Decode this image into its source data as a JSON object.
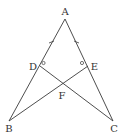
{
  "diagram": {
    "type": "geometry",
    "points": {
      "A": {
        "label": "A",
        "x": 65,
        "y": 19
      },
      "B": {
        "label": "B",
        "x": 9,
        "y": 121
      },
      "C": {
        "label": "C",
        "x": 113,
        "y": 121
      },
      "D": {
        "label": "D",
        "x": 40,
        "y": 66
      },
      "E": {
        "label": "E",
        "x": 88,
        "y": 66
      },
      "F": {
        "label": "F",
        "x": 63,
        "y": 82
      }
    },
    "segments": [
      "AB",
      "AC",
      "DC",
      "EB"
    ],
    "marks": {
      "equal_ticks": [
        "AD",
        "AE"
      ],
      "equal_angles": [
        "ADC",
        "AEB"
      ]
    },
    "colors": {
      "line": "#3a3a3a",
      "label": "#333333",
      "background": "#ffffff"
    }
  }
}
